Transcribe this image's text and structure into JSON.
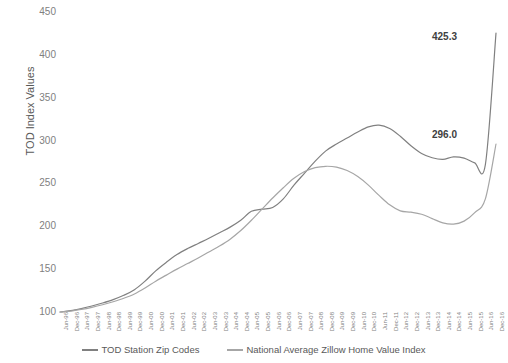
{
  "chart_data": {
    "type": "line",
    "title": "",
    "xlabel": "",
    "ylabel": "TOD Index Values",
    "ylim": [
      100,
      450
    ],
    "yticks": [
      100,
      150,
      200,
      250,
      300,
      350,
      400,
      450
    ],
    "grid": false,
    "legend_position": "bottom",
    "categories": [
      "Jun-96",
      "Dec-96",
      "Jun-97",
      "Dec-97",
      "Jun-98",
      "Dec-98",
      "Jun-99",
      "Dec-99",
      "Jun-00",
      "Dec-00",
      "Jun-01",
      "Dec-01",
      "Jun-02",
      "Dec-02",
      "Jun-03",
      "Dec-03",
      "Jun-04",
      "Dec-04",
      "Jun-05",
      "Dec-05",
      "Jun-06",
      "Dec-06",
      "Jun-07",
      "Dec-07",
      "Jun-08",
      "Dec-08",
      "Jun-09",
      "Dec-09",
      "Jun-10",
      "Dec-10",
      "Jun-11",
      "Dec-11",
      "Jun-12",
      "Dec-12",
      "Jun-13",
      "Dec-13",
      "Jun-14",
      "Dec-14",
      "Jun-15",
      "Dec-15",
      "Jun-16",
      "Dec-16"
    ],
    "series": [
      {
        "name": "TOD Station Zip Codes",
        "color": "#808080",
        "end_label": "425.3",
        "values": [
          100.0,
          101.5,
          104.0,
          107.0,
          110.5,
          114.5,
          119.5,
          126.0,
          136.0,
          148.0,
          158.0,
          167.0,
          174.0,
          180.0,
          186.0,
          192.5,
          199.0,
          207.0,
          217.5,
          220.0,
          222.0,
          232.0,
          248.0,
          262.0,
          276.0,
          288.0,
          296.0,
          303.0,
          310.0,
          316.0,
          318.0,
          314.0,
          305.0,
          294.0,
          285.0,
          280.0,
          278.0,
          281.0,
          279.5,
          274.0,
          272.0,
          425.3
        ]
      },
      {
        "name": "National Average Zillow Home Value Index",
        "color": "#a6a6a6",
        "end_label": "296.0",
        "values": [
          100.0,
          101.0,
          103.0,
          105.5,
          108.5,
          112.0,
          116.0,
          121.0,
          128.0,
          136.0,
          143.0,
          150.0,
          156.5,
          163.0,
          170.0,
          177.0,
          185.0,
          195.0,
          207.0,
          220.0,
          233.0,
          245.0,
          256.0,
          264.0,
          268.5,
          270.0,
          269.0,
          265.0,
          258.0,
          248.0,
          236.0,
          225.0,
          218.0,
          216.5,
          214.0,
          209.0,
          204.0,
          202.5,
          206.0,
          216.0,
          232.0,
          296.0
        ]
      }
    ],
    "annotations": [
      {
        "text": "425.3",
        "series": "TOD Station Zip Codes",
        "at": "Dec-16"
      },
      {
        "text": "296.0",
        "series": "National Average Zillow Home Value Index",
        "at": "Dec-16"
      }
    ]
  },
  "legend": {
    "items": [
      {
        "label": "TOD Station Zip Codes",
        "color": "#808080"
      },
      {
        "label": "National Average Zillow Home Value Index",
        "color": "#a6a6a6"
      }
    ]
  }
}
